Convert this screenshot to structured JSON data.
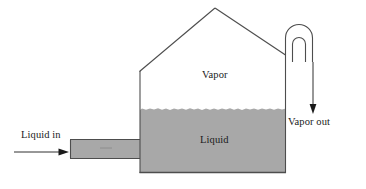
{
  "diagram": {
    "type": "process-flow-diagram",
    "labels": {
      "vapor": "Vapor",
      "liquid": "Liquid",
      "liquid_in": "Liquid in",
      "vapor_out": "Vapor out"
    },
    "colors": {
      "liquid_fill": "#a8a8a8",
      "vapor_fill": "#ffffff",
      "outline": "#4d4d4d",
      "text": "#1a1a1a",
      "background": "#ffffff"
    },
    "parts": {
      "vessel_body": "vessel-body",
      "roof": "gabled-roof",
      "liquid_pool": "liquid-pool",
      "liquid_surface": "wavy-liquid-surface",
      "inlet_pipe": "liquid-inlet-pipe",
      "inlet_arrow": "liquid-in-arrow",
      "outlet_tube": "inverted-u-vapor-tube",
      "outlet_arrow": "vapor-out-arrow"
    }
  }
}
